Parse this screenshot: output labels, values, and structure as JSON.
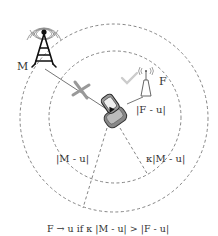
{
  "diagram": {
    "macro_label": "M",
    "femto_label": "F",
    "femto_distance_label": "|F - u|",
    "macro_distance_label": "|M - u|",
    "scaled_distance_label": "κ|M - u|",
    "rule_caption": "F → u if κ |M - u| > |F - u|",
    "colors": {
      "line": "#555555",
      "dashed": "#777777",
      "cross": "#999999",
      "check": "#cccccc",
      "tower": "#111111"
    }
  }
}
